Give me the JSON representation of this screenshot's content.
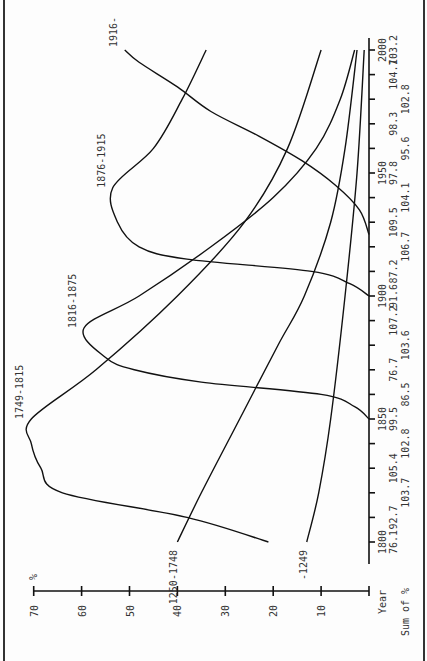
{
  "chart_data": {
    "type": "line",
    "orientation": "rotated-90",
    "title": "",
    "xlabel": "Year",
    "ylabel": "%",
    "secondary_label": "Sum of %",
    "ylim": [
      0,
      70
    ],
    "xlim": [
      1800,
      2000
    ],
    "y_ticks": [
      10,
      20,
      30,
      40,
      50,
      60,
      70
    ],
    "x_ticks": [
      1800,
      1850,
      1900,
      1950,
      2000
    ],
    "x_minor_ticks_step": 10,
    "sum_of_percent": {
      "years": [
        1800,
        1810,
        1820,
        1830,
        1840,
        1850,
        1860,
        1870,
        1880,
        1890,
        1900,
        1910,
        1920,
        1930,
        1940,
        1950,
        1960,
        1970,
        1980,
        1990,
        2000
      ],
      "values": [
        "76.1",
        "92.7",
        "103.7",
        "105.4",
        "102.8",
        "99.5",
        "86.5",
        "76.7",
        "103.6",
        "107.2",
        "91.6",
        "87.2",
        "106.7",
        "109.5",
        "104.1",
        "97.8",
        "95.6",
        "98.3",
        "102.8",
        "104.7",
        "103.2"
      ]
    },
    "series": [
      {
        "name": "-1249",
        "points": [
          [
            1800,
            13
          ],
          [
            1820,
            10.5
          ],
          [
            1850,
            8
          ],
          [
            1900,
            5
          ],
          [
            1950,
            2.5
          ],
          [
            2000,
            1
          ]
        ]
      },
      {
        "name": "1250-1748",
        "points": [
          [
            1800,
            40
          ],
          [
            1820,
            35
          ],
          [
            1850,
            27
          ],
          [
            1880,
            19
          ],
          [
            1900,
            13.5
          ],
          [
            1930,
            8
          ],
          [
            1960,
            5
          ],
          [
            2000,
            2.5
          ]
        ]
      },
      {
        "name": "1749-1815",
        "points": [
          [
            1800,
            21
          ],
          [
            1810,
            38
          ],
          [
            1820,
            64
          ],
          [
            1830,
            68.5
          ],
          [
            1840,
            70.5
          ],
          [
            1850,
            70.5
          ],
          [
            1870,
            57
          ],
          [
            1900,
            40
          ],
          [
            1930,
            26
          ],
          [
            1960,
            17
          ],
          [
            2000,
            10
          ]
        ]
      },
      {
        "name": "1816-1875",
        "points": [
          [
            1850,
            0
          ],
          [
            1855,
            3
          ],
          [
            1860,
            10
          ],
          [
            1865,
            35
          ],
          [
            1870,
            49
          ],
          [
            1875,
            55
          ],
          [
            1887,
            59.5
          ],
          [
            1900,
            48
          ],
          [
            1920,
            33
          ],
          [
            1940,
            20
          ],
          [
            1960,
            11
          ],
          [
            1980,
            6
          ],
          [
            2000,
            3
          ]
        ]
      },
      {
        "name": "1876-1915",
        "points": [
          [
            1900,
            0
          ],
          [
            1905,
            4
          ],
          [
            1910,
            12
          ],
          [
            1915,
            38
          ],
          [
            1920,
            48
          ],
          [
            1930,
            52.5
          ],
          [
            1944,
            53.5
          ],
          [
            1960,
            45
          ],
          [
            1980,
            39
          ],
          [
            2000,
            34
          ]
        ]
      },
      {
        "name": "1916-",
        "points": [
          [
            1925,
            0
          ],
          [
            1935,
            2
          ],
          [
            1945,
            7
          ],
          [
            1955,
            14
          ],
          [
            1965,
            23
          ],
          [
            1975,
            33
          ],
          [
            1985,
            40
          ],
          [
            1995,
            48
          ],
          [
            2000,
            51
          ]
        ]
      }
    ],
    "series_labels": {
      "-1249": {
        "year": 1800,
        "pct": 13
      },
      "1250-1748": {
        "year": 1800,
        "pct": 40
      },
      "1749-1815": {
        "year": 1850,
        "pct": 70.5
      },
      "1816-1875": {
        "year": 1887,
        "pct": 59.5
      },
      "1876-1915": {
        "year": 1944,
        "pct": 53.5
      },
      "1916-": {
        "year": 2000,
        "pct": 51
      }
    },
    "grid": false,
    "legend": "inline labels at curve ends"
  }
}
